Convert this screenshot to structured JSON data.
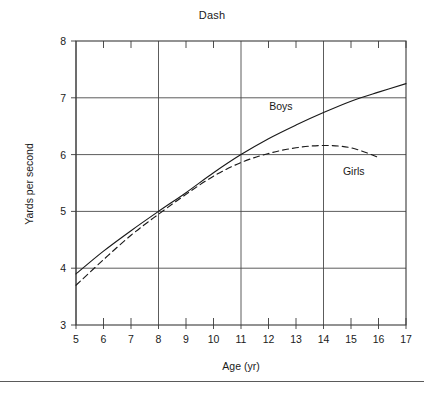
{
  "figure": {
    "title": "Dash",
    "footer_rule": true
  },
  "chart_data": {
    "type": "line",
    "title": "Dash",
    "xlabel": "Age (yr)",
    "ylabel": "Yards per second",
    "xlim": [
      5,
      17
    ],
    "ylim": [
      3,
      8
    ],
    "grid": true,
    "grid_x_values": [
      5,
      8,
      11,
      14
    ],
    "grid_y_values": [
      4,
      5,
      6,
      7
    ],
    "x_ticks": [
      5,
      6,
      7,
      8,
      9,
      10,
      11,
      12,
      13,
      14,
      15,
      16,
      17
    ],
    "x_tick_labels": [
      "5",
      "6",
      "7",
      "8",
      "9",
      "10",
      "11",
      "12",
      "13",
      "14",
      "15",
      "16",
      "17"
    ],
    "y_ticks": [
      3,
      4,
      5,
      6,
      7,
      8
    ],
    "y_tick_labels": [
      "3",
      "4",
      "5",
      "6",
      "7",
      "8"
    ],
    "legend_position": "inline-annotation",
    "series": [
      {
        "name": "Boys",
        "style": "solid",
        "color": "#1a1a1a",
        "label_x": 12.45,
        "label_y": 6.78,
        "x": [
          5,
          6,
          7,
          8,
          9,
          10,
          11,
          12,
          13,
          14,
          15,
          16,
          17
        ],
        "values": [
          3.9,
          4.3,
          4.66,
          5.0,
          5.33,
          5.68,
          6.0,
          6.28,
          6.52,
          6.74,
          6.94,
          7.1,
          7.25
        ]
      },
      {
        "name": "Girls",
        "style": "dashed",
        "color": "#1a1a1a",
        "label_x": 15.1,
        "label_y": 5.64,
        "x": [
          5,
          6,
          7,
          8,
          9,
          10,
          11,
          12,
          13,
          14,
          15,
          16
        ],
        "values": [
          3.7,
          4.15,
          4.58,
          4.95,
          5.3,
          5.62,
          5.86,
          6.02,
          6.12,
          6.16,
          6.12,
          5.95
        ]
      }
    ]
  }
}
